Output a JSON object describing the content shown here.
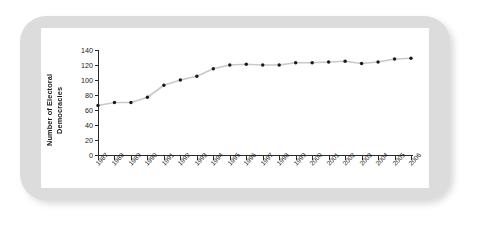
{
  "chart_data": {
    "type": "line",
    "title": "",
    "xlabel": "",
    "ylabel": "Number of Electoral Democracies",
    "categories": [
      "1987",
      "1988",
      "1989",
      "1990",
      "1991",
      "1992",
      "1993",
      "1994",
      "1995",
      "1996",
      "1997",
      "1998",
      "1999",
      "2000",
      "2001",
      "2002",
      "2003",
      "2004",
      "2005",
      "2006"
    ],
    "values": [
      66,
      70,
      70,
      77,
      93,
      100,
      105,
      115,
      120,
      121,
      120,
      120,
      123,
      123,
      124,
      125,
      122,
      124,
      128,
      129
    ],
    "series": [
      {
        "name": "Number of Electoral Democracies",
        "values": [
          66,
          70,
          70,
          77,
          93,
          100,
          105,
          115,
          120,
          121,
          120,
          120,
          123,
          123,
          124,
          125,
          122,
          124,
          128,
          129
        ]
      }
    ],
    "ylim": [
      0,
      140
    ],
    "ytick_labels": [
      "0",
      "20",
      "40",
      "60",
      "80",
      "100",
      "120",
      "140"
    ],
    "ytick_values": [
      0,
      20,
      40,
      60,
      80,
      100,
      120,
      140
    ],
    "grid": false,
    "legend": false,
    "marker": "dot",
    "line_color": "#c9c9c9",
    "marker_color": "#1a1a1a",
    "axis_color": "#2a2a2a"
  },
  "figure": {
    "frame_color": "#dcdcdc",
    "panel_color": "#ffffff"
  }
}
